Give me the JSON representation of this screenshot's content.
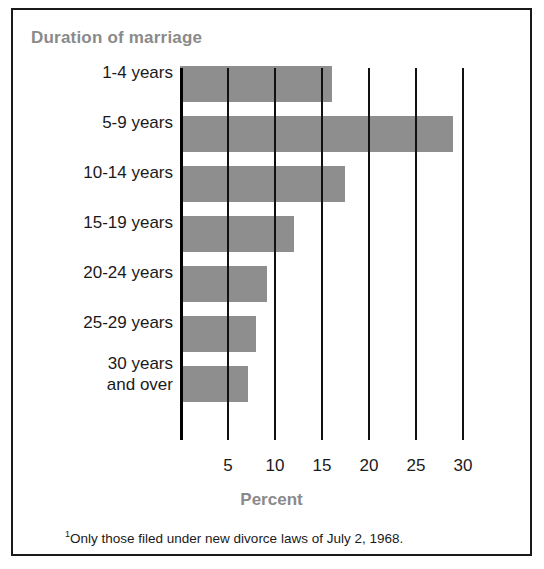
{
  "chart_data": {
    "type": "bar",
    "orientation": "horizontal",
    "title": "Duration of marriage",
    "xlabel": "Percent",
    "ylabel": "",
    "categories": [
      "1-4 years",
      "5-9 years",
      "10-14 years",
      "15-19 years",
      "20-24 years",
      "25-29 years",
      "30 years\nand over"
    ],
    "values": [
      16.2,
      29.0,
      17.5,
      12.1,
      9.3,
      8.1,
      7.2
    ],
    "xlim": [
      0,
      31.5
    ],
    "xticks": [
      0,
      5,
      10,
      15,
      20,
      25,
      30
    ],
    "xtick_labels": [
      "",
      "5",
      "10",
      "15",
      "20",
      "25",
      "30"
    ],
    "grid": true,
    "legend": null,
    "bar_color": "#8e8e8e",
    "title_color": "#8a8a8a",
    "axis_color": "#111111",
    "footnote": "Only those filed under new divorce laws of  July 2, 1968.",
    "footnote_marker": "1"
  }
}
